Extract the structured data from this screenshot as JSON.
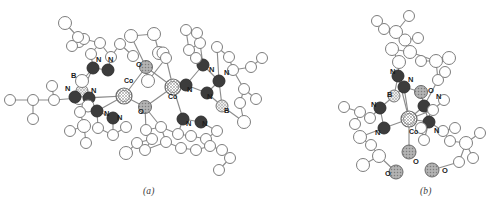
{
  "figure": {
    "type": "crystal-structure-diagram",
    "style": "ortep-ball-and-stick",
    "background": "#ffffff",
    "panels": [
      {
        "id": "a",
        "caption": "(a)",
        "description": "Dinuclear cobalt complex with two bridging oxo groups"
      },
      {
        "id": "b",
        "caption": "(b)",
        "description": "Mononuclear cobalt tris(pyrazolyl)borate complex"
      }
    ]
  },
  "legend": {
    "atom_types": [
      {
        "symbol": "Co",
        "name": "cobalt",
        "fill": "#ffffff",
        "pattern": "cross-hatch",
        "stroke": "#6b6b6b",
        "radius": 8
      },
      {
        "symbol": "N",
        "name": "nitrogen",
        "fill": "#3c3c3c",
        "pattern": "solid",
        "stroke": "#2a2a2a",
        "radius": 6
      },
      {
        "symbol": "O",
        "name": "oxygen",
        "fill": "#a8a8a8",
        "pattern": "dot-hatch",
        "stroke": "#6b6b6b",
        "radius": 6.5
      },
      {
        "symbol": "B",
        "name": "boron",
        "fill": "#e0e0e0",
        "pattern": "cross-hatch",
        "stroke": "#7a7a7a",
        "radius": 6
      },
      {
        "symbol": "C",
        "name": "carbon",
        "fill": "#ffffff",
        "pattern": "open",
        "stroke": "#7d7d7d",
        "radius": 5.5
      }
    ],
    "bond_stroke": "#8a8a8a",
    "label_color": "#1c1c1c"
  },
  "labels": {
    "panel_a": [
      {
        "text": "N",
        "x": 96,
        "y": 62
      },
      {
        "text": "N",
        "x": 108,
        "y": 62
      },
      {
        "text": "O",
        "x": 136,
        "y": 67
      },
      {
        "text": "Co",
        "x": 124,
        "y": 83
      },
      {
        "text": "B",
        "x": 71,
        "y": 78
      },
      {
        "text": "N",
        "x": 65,
        "y": 91
      },
      {
        "text": "N",
        "x": 91,
        "y": 93
      },
      {
        "text": "N",
        "x": 104,
        "y": 116
      },
      {
        "text": "N",
        "x": 117,
        "y": 120
      },
      {
        "text": "O",
        "x": 138,
        "y": 114
      },
      {
        "text": "Co",
        "x": 168,
        "y": 99
      },
      {
        "text": "N",
        "x": 187,
        "y": 92
      },
      {
        "text": "N",
        "x": 209,
        "y": 72
      },
      {
        "text": "N",
        "x": 224,
        "y": 75
      },
      {
        "text": "N",
        "x": 207,
        "y": 99
      },
      {
        "text": "B",
        "x": 224,
        "y": 113
      },
      {
        "text": "N",
        "x": 186,
        "y": 126
      },
      {
        "text": "N",
        "x": 202,
        "y": 126
      }
    ],
    "panel_b": [
      {
        "text": "N",
        "x": 390,
        "y": 74
      },
      {
        "text": "N",
        "x": 408,
        "y": 82
      },
      {
        "text": "B",
        "x": 387,
        "y": 97
      },
      {
        "text": "O",
        "x": 428,
        "y": 93
      },
      {
        "text": "N",
        "x": 436,
        "y": 99
      },
      {
        "text": "N",
        "x": 371,
        "y": 107
      },
      {
        "text": "N",
        "x": 375,
        "y": 135
      },
      {
        "text": "Co",
        "x": 409,
        "y": 134
      },
      {
        "text": "N",
        "x": 434,
        "y": 133
      },
      {
        "text": "O",
        "x": 413,
        "y": 164
      },
      {
        "text": "O",
        "x": 385,
        "y": 176
      },
      {
        "text": "O",
        "x": 442,
        "y": 173
      }
    ]
  },
  "chart_data": {
    "type": "scatter",
    "title": "",
    "xlabel": "",
    "ylabel": "",
    "note": "Atom coordinates in image pixel space; r = drawn radius; type = element",
    "panel_a_atoms": [
      {
        "t": "C",
        "x": 10,
        "y": 100,
        "r": 5.5
      },
      {
        "t": "C",
        "x": 33,
        "y": 100,
        "r": 5.5
      },
      {
        "t": "C",
        "x": 33,
        "y": 119,
        "r": 5.5
      },
      {
        "t": "C",
        "x": 54,
        "y": 100,
        "r": 5.5
      },
      {
        "t": "C",
        "x": 52,
        "y": 86,
        "r": 5.5
      },
      {
        "t": "C",
        "x": 79,
        "y": 98,
        "r": 6.5
      },
      {
        "t": "B",
        "x": 82,
        "y": 91,
        "r": 6
      },
      {
        "t": "N",
        "x": 75,
        "y": 97,
        "r": 6
      },
      {
        "t": "N",
        "x": 89,
        "y": 98,
        "r": 6
      },
      {
        "t": "C",
        "x": 82,
        "y": 81,
        "r": 6.5
      },
      {
        "t": "C",
        "x": 88,
        "y": 106,
        "r": 6
      },
      {
        "t": "C",
        "x": 80,
        "y": 112,
        "r": 5.5
      },
      {
        "t": "C",
        "x": 84,
        "y": 126,
        "r": 6.5
      },
      {
        "t": "C",
        "x": 70,
        "y": 131,
        "r": 5.5
      },
      {
        "t": "N",
        "x": 97,
        "y": 111,
        "r": 6
      },
      {
        "t": "N",
        "x": 113,
        "y": 118,
        "r": 6
      },
      {
        "t": "C",
        "x": 98,
        "y": 128,
        "r": 5.5
      },
      {
        "t": "C",
        "x": 113,
        "y": 135,
        "r": 5.5
      },
      {
        "t": "C",
        "x": 126,
        "y": 127,
        "r": 5.5
      },
      {
        "t": "C",
        "x": 86,
        "y": 143,
        "r": 5.5
      },
      {
        "t": "N",
        "x": 93,
        "y": 68,
        "r": 6
      },
      {
        "t": "N",
        "x": 108,
        "y": 70,
        "r": 6
      },
      {
        "t": "C",
        "x": 91,
        "y": 54,
        "r": 5.5
      },
      {
        "t": "C",
        "x": 100,
        "y": 43,
        "r": 5.5
      },
      {
        "t": "C",
        "x": 111,
        "y": 57,
        "r": 5.5
      },
      {
        "t": "C",
        "x": 79,
        "y": 42,
        "r": 5.5
      },
      {
        "t": "C",
        "x": 84,
        "y": 39,
        "r": 5.5
      },
      {
        "t": "C",
        "x": 72,
        "y": 46,
        "r": 5.5
      },
      {
        "t": "C",
        "x": 65,
        "y": 23,
        "r": 6.5
      },
      {
        "t": "C",
        "x": 78,
        "y": 37,
        "r": 5.5
      },
      {
        "t": "C",
        "x": 120,
        "y": 44,
        "r": 5.5
      },
      {
        "t": "C",
        "x": 133,
        "y": 56,
        "r": 5.5
      },
      {
        "t": "Co",
        "x": 124,
        "y": 96,
        "r": 8
      },
      {
        "t": "O",
        "x": 146,
        "y": 67,
        "r": 6.5
      },
      {
        "t": "O",
        "x": 145,
        "y": 107,
        "r": 6.5
      },
      {
        "t": "Co",
        "x": 173,
        "y": 87,
        "r": 8
      },
      {
        "t": "C",
        "x": 131,
        "y": 36,
        "r": 6.5
      },
      {
        "t": "C",
        "x": 154,
        "y": 34,
        "r": 6.5
      },
      {
        "t": "C",
        "x": 159,
        "y": 53,
        "r": 6.5
      },
      {
        "t": "C",
        "x": 148,
        "y": 81,
        "r": 6.5
      },
      {
        "t": "C",
        "x": 163,
        "y": 53,
        "r": 6
      },
      {
        "t": "C",
        "x": 166,
        "y": 58,
        "r": 5.5
      },
      {
        "t": "N",
        "x": 186,
        "y": 85,
        "r": 6
      },
      {
        "t": "N",
        "x": 203,
        "y": 65,
        "r": 6
      },
      {
        "t": "N",
        "x": 219,
        "y": 81,
        "r": 6
      },
      {
        "t": "N",
        "x": 207,
        "y": 93,
        "r": 6
      },
      {
        "t": "B",
        "x": 222,
        "y": 106,
        "r": 6
      },
      {
        "t": "C",
        "x": 200,
        "y": 43,
        "r": 5.5
      },
      {
        "t": "C",
        "x": 189,
        "y": 50,
        "r": 5.5
      },
      {
        "t": "C",
        "x": 196,
        "y": 58,
        "r": 5.5
      },
      {
        "t": "C",
        "x": 217,
        "y": 47,
        "r": 5.5
      },
      {
        "t": "C",
        "x": 229,
        "y": 57,
        "r": 5.5
      },
      {
        "t": "C",
        "x": 233,
        "y": 70,
        "r": 5.5
      },
      {
        "t": "C",
        "x": 186,
        "y": 30,
        "r": 5.5
      },
      {
        "t": "C",
        "x": 197,
        "y": 33,
        "r": 5.5
      },
      {
        "t": "C",
        "x": 251,
        "y": 67,
        "r": 5.5
      },
      {
        "t": "C",
        "x": 262,
        "y": 58,
        "r": 5.5
      },
      {
        "t": "C",
        "x": 244,
        "y": 89,
        "r": 5.5
      },
      {
        "t": "C",
        "x": 256,
        "y": 99,
        "r": 5.5
      },
      {
        "t": "C",
        "x": 240,
        "y": 103,
        "r": 5.5
      },
      {
        "t": "C",
        "x": 244,
        "y": 122,
        "r": 6.5
      },
      {
        "t": "N",
        "x": 183,
        "y": 119,
        "r": 6
      },
      {
        "t": "N",
        "x": 201,
        "y": 122,
        "r": 6
      },
      {
        "t": "C",
        "x": 217,
        "y": 131,
        "r": 5.5
      },
      {
        "t": "C",
        "x": 206,
        "y": 139,
        "r": 5.5
      },
      {
        "t": "C",
        "x": 191,
        "y": 136,
        "r": 5.5
      },
      {
        "t": "C",
        "x": 178,
        "y": 134,
        "r": 5.5
      },
      {
        "t": "C",
        "x": 161,
        "y": 127,
        "r": 5.5
      },
      {
        "t": "C",
        "x": 146,
        "y": 130,
        "r": 5.5
      },
      {
        "t": "C",
        "x": 152,
        "y": 139,
        "r": 5.5
      },
      {
        "t": "C",
        "x": 137,
        "y": 143,
        "r": 5.5
      },
      {
        "t": "C",
        "x": 126,
        "y": 153,
        "r": 6.5
      },
      {
        "t": "C",
        "x": 145,
        "y": 150,
        "r": 5.5
      },
      {
        "t": "C",
        "x": 166,
        "y": 142,
        "r": 5.5
      },
      {
        "t": "C",
        "x": 181,
        "y": 148,
        "r": 5.5
      },
      {
        "t": "C",
        "x": 196,
        "y": 150,
        "r": 5.5
      },
      {
        "t": "C",
        "x": 210,
        "y": 146,
        "r": 5.5
      },
      {
        "t": "C",
        "x": 222,
        "y": 150,
        "r": 5.5
      },
      {
        "t": "C",
        "x": 230,
        "y": 158,
        "r": 5.5
      },
      {
        "t": "C",
        "x": 219,
        "y": 170,
        "r": 5.5
      }
    ],
    "panel_b_atoms": [
      {
        "t": "Co",
        "x": 409,
        "y": 119,
        "r": 8
      },
      {
        "t": "B",
        "x": 394,
        "y": 96,
        "r": 6
      },
      {
        "t": "N",
        "x": 398,
        "y": 76,
        "r": 6
      },
      {
        "t": "N",
        "x": 404,
        "y": 87,
        "r": 6
      },
      {
        "t": "N",
        "x": 380,
        "y": 108,
        "r": 6
      },
      {
        "t": "N",
        "x": 384,
        "y": 128,
        "r": 6
      },
      {
        "t": "N",
        "x": 424,
        "y": 106,
        "r": 6
      },
      {
        "t": "N",
        "x": 429,
        "y": 122,
        "r": 6
      },
      {
        "t": "O",
        "x": 421,
        "y": 92,
        "r": 6.5
      },
      {
        "t": "O",
        "x": 409,
        "y": 152,
        "r": 7
      },
      {
        "t": "O",
        "x": 396,
        "y": 172,
        "r": 7
      },
      {
        "t": "O",
        "x": 432,
        "y": 170,
        "r": 7
      },
      {
        "t": "C",
        "x": 399,
        "y": 62,
        "r": 6.5
      },
      {
        "t": "C",
        "x": 392,
        "y": 49,
        "r": 6.5
      },
      {
        "t": "C",
        "x": 410,
        "y": 52,
        "r": 6.5
      },
      {
        "t": "C",
        "x": 405,
        "y": 40,
        "r": 6
      },
      {
        "t": "C",
        "x": 418,
        "y": 38,
        "r": 5.5
      },
      {
        "t": "C",
        "x": 396,
        "y": 32,
        "r": 6.5
      },
      {
        "t": "C",
        "x": 384,
        "y": 29,
        "r": 5.5
      },
      {
        "t": "C",
        "x": 409,
        "y": 16,
        "r": 5.5
      },
      {
        "t": "C",
        "x": 377,
        "y": 21,
        "r": 5.5
      },
      {
        "t": "C",
        "x": 436,
        "y": 61,
        "r": 6.5
      },
      {
        "t": "C",
        "x": 449,
        "y": 58,
        "r": 6.5
      },
      {
        "t": "C",
        "x": 421,
        "y": 61,
        "r": 5.5
      },
      {
        "t": "C",
        "x": 438,
        "y": 80,
        "r": 5.5
      },
      {
        "t": "C",
        "x": 445,
        "y": 72,
        "r": 5.5
      },
      {
        "t": "C",
        "x": 370,
        "y": 118,
        "r": 5.5
      },
      {
        "t": "C",
        "x": 360,
        "y": 112,
        "r": 5.5
      },
      {
        "t": "C",
        "x": 355,
        "y": 124,
        "r": 5.5
      },
      {
        "t": "C",
        "x": 344,
        "y": 107,
        "r": 5.5
      },
      {
        "t": "C",
        "x": 360,
        "y": 137,
        "r": 6.5
      },
      {
        "t": "C",
        "x": 371,
        "y": 145,
        "r": 5.5
      },
      {
        "t": "C",
        "x": 379,
        "y": 156,
        "r": 6.5
      },
      {
        "t": "C",
        "x": 363,
        "y": 165,
        "r": 6.5
      },
      {
        "t": "C",
        "x": 443,
        "y": 131,
        "r": 5.5
      },
      {
        "t": "C",
        "x": 455,
        "y": 128,
        "r": 5.5
      },
      {
        "t": "C",
        "x": 450,
        "y": 141,
        "r": 5.5
      },
      {
        "t": "C",
        "x": 466,
        "y": 143,
        "r": 6.5
      },
      {
        "t": "C",
        "x": 480,
        "y": 133,
        "r": 5.5
      },
      {
        "t": "C",
        "x": 473,
        "y": 158,
        "r": 5.5
      },
      {
        "t": "C",
        "x": 459,
        "y": 162,
        "r": 5.5
      },
      {
        "t": "C",
        "x": 424,
        "y": 140,
        "r": 5.5
      },
      {
        "t": "C",
        "x": 421,
        "y": 128,
        "r": 5.5
      },
      {
        "t": "C",
        "x": 433,
        "y": 110,
        "r": 5.5
      },
      {
        "t": "C",
        "x": 444,
        "y": 100,
        "r": 5.5
      }
    ]
  }
}
